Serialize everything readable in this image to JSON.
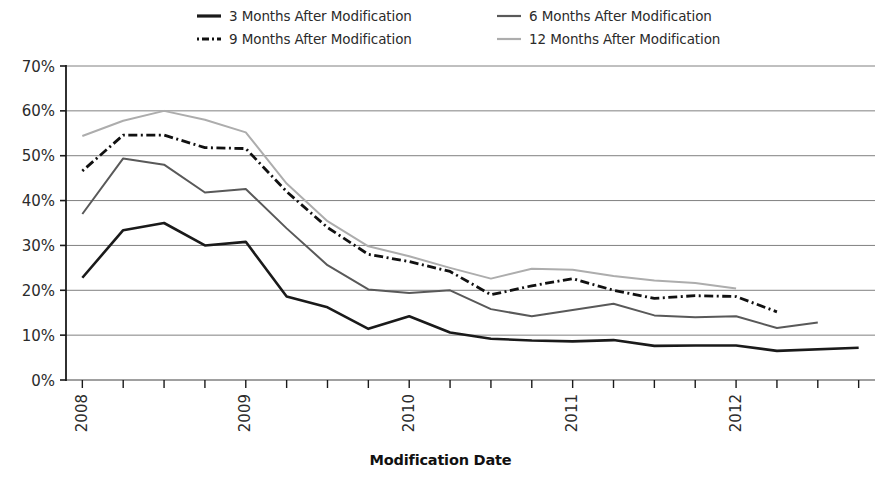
{
  "chart_data": {
    "type": "line",
    "title": "",
    "xlabel": "Modification Date",
    "ylabel": "",
    "ylim": [
      0,
      70
    ],
    "ytick_labels": [
      "0%",
      "10%",
      "20%",
      "30%",
      "40%",
      "50%",
      "60%",
      "70%"
    ],
    "ytick_values": [
      0,
      10,
      20,
      30,
      40,
      50,
      60,
      70
    ],
    "xtick_labels": [
      "2008",
      "2009",
      "2010",
      "2011",
      "2012"
    ],
    "xtick_values": [
      2008,
      2009,
      2010,
      2011,
      2012
    ],
    "x_minor_ticks_per_year": 4,
    "xlim": [
      2007.9,
      2012.85
    ],
    "grid": "horizontal",
    "legend_position": "top",
    "series": [
      {
        "name": "3 Months After Modification",
        "color": "#1a1a1a",
        "style": "solid",
        "width": 2.6,
        "x": [
          2008.0,
          2008.25,
          2008.5,
          2008.75,
          2009.0,
          2009.25,
          2009.5,
          2009.75,
          2010.0,
          2010.25,
          2010.5,
          2010.75,
          2011.0,
          2011.25,
          2011.5,
          2011.75,
          2012.0,
          2012.25,
          2012.75
        ],
        "values": [
          22.8,
          33.4,
          35.0,
          30.0,
          30.8,
          18.6,
          16.2,
          11.4,
          14.2,
          10.6,
          9.2,
          8.8,
          8.6,
          8.9,
          7.6,
          7.7,
          7.7,
          6.5,
          7.2
        ]
      },
      {
        "name": "6 Months After Modification",
        "color": "#595959",
        "style": "solid",
        "width": 2.0,
        "x": [
          2008.0,
          2008.25,
          2008.5,
          2008.75,
          2009.0,
          2009.25,
          2009.5,
          2009.75,
          2010.0,
          2010.25,
          2010.5,
          2010.75,
          2011.0,
          2011.25,
          2011.5,
          2011.75,
          2012.0,
          2012.25,
          2012.5
        ],
        "values": [
          37.0,
          49.4,
          48.0,
          41.8,
          42.6,
          33.8,
          25.6,
          20.2,
          19.4,
          20.0,
          15.8,
          14.2,
          15.6,
          17.0,
          14.4,
          14.0,
          14.2,
          11.6,
          12.8
        ]
      },
      {
        "name": "9 Months After Modification",
        "color": "#111111",
        "style": "dashdot",
        "width": 2.8,
        "x": [
          2008.0,
          2008.25,
          2008.5,
          2008.75,
          2009.0,
          2009.25,
          2009.5,
          2009.75,
          2010.0,
          2010.25,
          2010.5,
          2010.75,
          2011.0,
          2011.25,
          2011.5,
          2011.75,
          2012.0,
          2012.25
        ],
        "values": [
          46.6,
          54.6,
          54.6,
          51.8,
          51.6,
          42.0,
          34.0,
          28.0,
          26.4,
          24.2,
          19.0,
          21.0,
          22.6,
          20.0,
          18.2,
          18.8,
          18.6,
          15.2
        ]
      },
      {
        "name": "12 Months After Modification",
        "color": "#adadad",
        "style": "solid",
        "width": 2.0,
        "x": [
          2008.0,
          2008.25,
          2008.5,
          2008.75,
          2009.0,
          2009.25,
          2009.5,
          2009.75,
          2010.0,
          2010.25,
          2010.5,
          2010.75,
          2011.0,
          2011.25,
          2011.5,
          2011.75,
          2012.0
        ],
        "values": [
          54.4,
          57.8,
          60.0,
          58.0,
          55.2,
          43.8,
          35.4,
          29.8,
          27.6,
          25.0,
          22.6,
          24.8,
          24.6,
          23.2,
          22.2,
          21.6,
          20.4
        ]
      }
    ]
  },
  "legend": {
    "items": [
      {
        "label": "3 Months After Modification",
        "swatch": "legend-swatch-3mo"
      },
      {
        "label": "6 Months After Modification",
        "swatch": "legend-swatch-6mo"
      },
      {
        "label": "9 Months After Modification",
        "swatch": "legend-swatch-9mo"
      },
      {
        "label": "12 Months After Modification",
        "swatch": "legend-swatch-12mo"
      }
    ]
  },
  "axes": {
    "x_title": "Modification Date"
  }
}
